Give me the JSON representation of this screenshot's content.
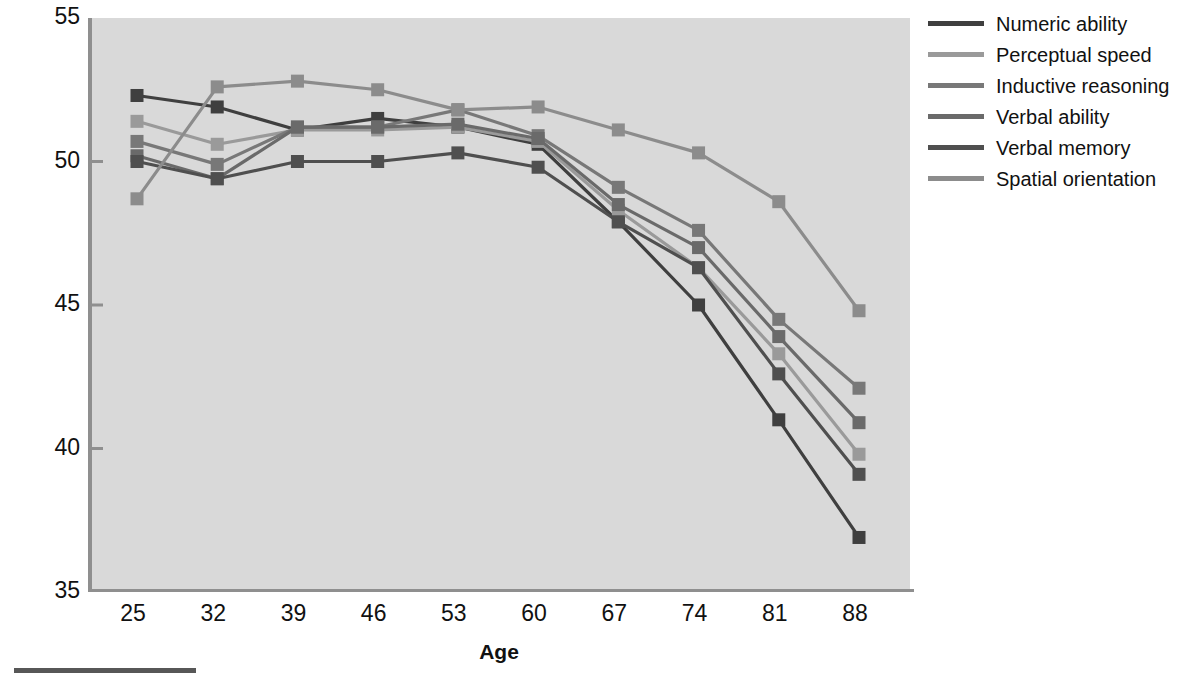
{
  "axes": {
    "ylabel_prefix": "Mean ",
    "ylabel_italic": "t",
    "ylabel_suffix": "-scores",
    "xlabel": "Age",
    "yticks": [
      "55",
      "50",
      "45",
      "40",
      "35"
    ],
    "xticks": [
      "25",
      "32",
      "39",
      "46",
      "53",
      "60",
      "67",
      "74",
      "81",
      "88"
    ]
  },
  "legend": {
    "items": [
      {
        "label": "Numeric ability",
        "color": "#3f3f3f"
      },
      {
        "label": "Perceptual speed",
        "color": "#9a9a9a"
      },
      {
        "label": "Inductive reasoning",
        "color": "#787878"
      },
      {
        "label": "Verbal ability",
        "color": "#6a6a6a"
      },
      {
        "label": "Verbal memory",
        "color": "#4f4f4f"
      },
      {
        "label": "Spatial orientation",
        "color": "#8c8c8c"
      }
    ]
  },
  "plot_style": {
    "background": "#d9d9d9",
    "axis_color": "#8f8f8f",
    "marker_size": 13
  },
  "chart_data": {
    "type": "line",
    "title": "",
    "xlabel": "Age",
    "ylabel": "Mean t-scores",
    "categories": [
      25,
      32,
      39,
      46,
      53,
      60,
      67,
      74,
      81,
      88
    ],
    "xlim": [
      25,
      88
    ],
    "ylim": [
      35,
      55
    ],
    "grid": false,
    "legend_position": "right",
    "markers": "square",
    "series": [
      {
        "name": "Numeric ability",
        "color": "#3f3f3f",
        "values": [
          52.3,
          51.9,
          51.1,
          51.5,
          51.2,
          50.6,
          47.9,
          45.0,
          41.0,
          36.9
        ]
      },
      {
        "name": "Perceptual speed",
        "color": "#9a9a9a",
        "values": [
          51.4,
          50.6,
          51.1,
          51.1,
          51.2,
          50.7,
          48.3,
          46.3,
          43.3,
          39.8
        ]
      },
      {
        "name": "Inductive reasoning",
        "color": "#787878",
        "values": [
          50.7,
          49.9,
          51.2,
          51.2,
          51.8,
          50.9,
          49.1,
          47.6,
          44.5,
          42.1
        ]
      },
      {
        "name": "Verbal ability",
        "color": "#6a6a6a",
        "values": [
          50.2,
          49.4,
          51.2,
          51.2,
          51.3,
          50.8,
          48.5,
          47.0,
          43.9,
          40.9
        ]
      },
      {
        "name": "Verbal memory",
        "color": "#4f4f4f",
        "values": [
          50.0,
          49.4,
          50.0,
          50.0,
          50.3,
          49.8,
          47.9,
          46.3,
          42.6,
          39.1
        ]
      },
      {
        "name": "Spatial orientation",
        "color": "#8c8c8c",
        "values": [
          48.7,
          52.6,
          52.8,
          52.5,
          51.8,
          51.9,
          51.1,
          50.3,
          48.6,
          44.8
        ]
      }
    ]
  }
}
